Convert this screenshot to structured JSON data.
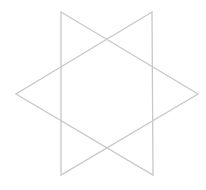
{
  "diagram": {
    "shape": "six-pointed-star",
    "background": "#ffffff",
    "stroke_color": "#c8c8c8",
    "stroke_width": 1.3,
    "triangles": [
      {
        "name": "triangle-pointing-right",
        "points": "61,12 198,94 61,175"
      },
      {
        "name": "triangle-pointing-left",
        "points": "152,12 16,94 153,175"
      }
    ]
  }
}
